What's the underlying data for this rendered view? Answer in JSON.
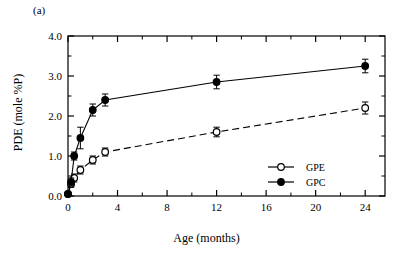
{
  "figure": {
    "panel_label": "(a)"
  },
  "chart_data": {
    "type": "line",
    "title": "",
    "xlabel": "Age (months)",
    "ylabel": "PDE (mole %P)",
    "xlim": [
      0,
      25.6
    ],
    "ylim": [
      0.0,
      4.0
    ],
    "xticks": [
      0,
      4,
      8,
      12,
      16,
      20,
      24
    ],
    "xticklabels": [
      "0",
      "4",
      "8",
      "12",
      "16",
      "20",
      "24"
    ],
    "yticks": [
      0.0,
      1.0,
      2.0,
      3.0,
      4.0
    ],
    "yticklabels": [
      "0.0",
      "1.0",
      "2.0",
      "3.0",
      "4.0"
    ],
    "yminorticks": [
      0.5,
      1.5,
      2.5,
      3.5
    ],
    "xminorticks": [
      2,
      6,
      10,
      14,
      18,
      22
    ],
    "grid": false,
    "legend_position": "lower right",
    "series": [
      {
        "name": "GPE",
        "marker": "open-circle",
        "linestyle": "dashed",
        "x": [
          0,
          0.25,
          0.5,
          1,
          2,
          3,
          12,
          24
        ],
        "values": [
          0.05,
          0.3,
          0.45,
          0.65,
          0.9,
          1.1,
          1.6,
          2.2
        ],
        "yerr": [
          0.03,
          0.08,
          0.1,
          0.1,
          0.1,
          0.1,
          0.12,
          0.15
        ]
      },
      {
        "name": "GPC",
        "marker": "filled-circle",
        "linestyle": "solid",
        "x": [
          0,
          0.25,
          0.5,
          1,
          2,
          3,
          12,
          24
        ],
        "values": [
          0.05,
          0.35,
          1.0,
          1.45,
          2.15,
          2.4,
          2.85,
          3.25
        ],
        "yerr": [
          0.03,
          0.1,
          0.1,
          0.27,
          0.15,
          0.15,
          0.17,
          0.17
        ]
      }
    ]
  }
}
